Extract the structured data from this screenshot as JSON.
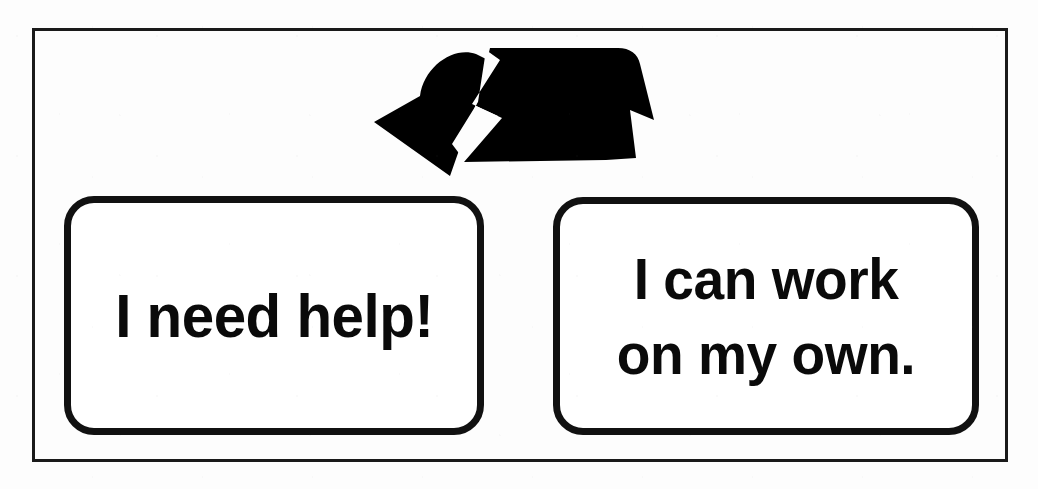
{
  "poster": {
    "title": "Choice board",
    "background_color": "#fdfdfd",
    "frame_color": "#1a1a1a",
    "ink_color": "#111111"
  },
  "graphic": {
    "name": "double-arrow-ribbon",
    "description": "Black folded ribbon arrow pointing down-right toward the two choice cards",
    "color": "#000000"
  },
  "options": [
    {
      "id": "help",
      "label": "I need help!",
      "lines": [
        "I need help!"
      ]
    },
    {
      "id": "independent",
      "label": "I can work on my own.",
      "lines": [
        "I can work",
        "on my own."
      ]
    }
  ]
}
